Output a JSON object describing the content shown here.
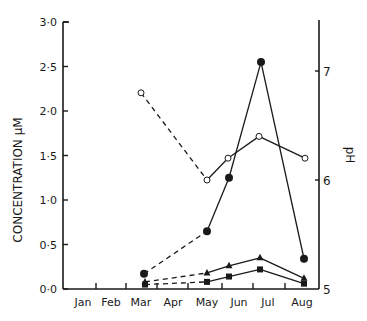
{
  "chart_data": {
    "type": "line",
    "title": "",
    "xlabel": "",
    "ylabel": "CONCENTRATION µM",
    "y2label": "pH",
    "categories": [
      "Jan",
      "Feb",
      "Mar",
      "Apr",
      "May",
      "Jun",
      "Jul",
      "Aug"
    ],
    "ylim": [
      0,
      3.0
    ],
    "y2lim": [
      5,
      7.5
    ],
    "yticks": [
      "0·0",
      "0·5",
      "1·0",
      "1·5",
      "2·0",
      "2·5",
      "3·0"
    ],
    "y2ticks": [
      "5",
      "6",
      "7"
    ],
    "grid": false,
    "legend": "none",
    "series": [
      {
        "name": "pH (open circles, right axis)",
        "marker": "open-circle",
        "axis": "right",
        "x": [
          "Mar",
          "May",
          "late May/Jun",
          "Jun/Jul",
          "Aug"
        ],
        "values": [
          6.8,
          6.0,
          6.2,
          6.4,
          6.2
        ],
        "dashed_segments": [
          [
            0,
            1
          ]
        ]
      },
      {
        "name": "Filled circles",
        "marker": "filled-circle",
        "axis": "left",
        "x": [
          "Mar",
          "May",
          "late May/Jun",
          "Jun/Jul",
          "Aug"
        ],
        "values": [
          0.17,
          0.65,
          1.25,
          2.55,
          0.34
        ],
        "dashed_segments": [
          [
            0,
            1
          ]
        ]
      },
      {
        "name": "Filled triangles",
        "marker": "filled-triangle",
        "axis": "left",
        "x": [
          "Mar",
          "May",
          "late May/Jun",
          "Jun/Jul",
          "Aug"
        ],
        "values": [
          0.08,
          0.18,
          0.26,
          0.35,
          0.12
        ],
        "dashed_segments": [
          [
            0,
            1
          ]
        ]
      },
      {
        "name": "Filled squares",
        "marker": "filled-square",
        "axis": "left",
        "x": [
          "Mar",
          "May",
          "late May/Jun",
          "Jun/Jul",
          "Aug"
        ],
        "values": [
          0.05,
          0.08,
          0.14,
          0.22,
          0.06
        ],
        "dashed_segments": [
          [
            0,
            1
          ]
        ]
      }
    ]
  },
  "labels": {
    "ylabel": "CONCENTRATION µM",
    "y2label": "pH",
    "months": [
      "Jan",
      "Feb",
      "Mar",
      "Apr",
      "May",
      "Jun",
      "Jul",
      "Aug"
    ],
    "yticks": [
      "0·0",
      "0·5",
      "1·0",
      "1·5",
      "2·0",
      "2·5",
      "3·0"
    ],
    "y2ticks": [
      "5",
      "6",
      "7"
    ]
  }
}
